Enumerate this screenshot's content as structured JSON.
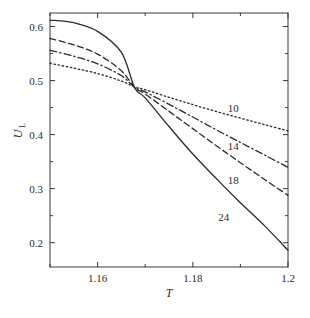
{
  "chart_data": {
    "type": "line",
    "title": "",
    "subtitle": "",
    "xlabel": "T",
    "ylabel": "U",
    "ylabel_sub": "L",
    "xlim": [
      1.15,
      1.2
    ],
    "ylim": [
      0.155,
      0.625
    ],
    "grid": false,
    "legend_position": "inline-right-of-curves",
    "xticks": [
      1.16,
      1.18,
      1.2
    ],
    "xtick_labels": [
      "1.16",
      "1.18",
      "1.2"
    ],
    "xticks_minor": [
      1.15,
      1.17,
      1.19
    ],
    "yticks": [
      0.2,
      0.3,
      0.4,
      0.5,
      0.6
    ],
    "ytick_labels": [
      "0.2",
      "0.3",
      "0.4",
      "0.5",
      "0.6"
    ],
    "yticks_minor": [
      0.25,
      0.35,
      0.45,
      0.55
    ],
    "crossing_point": [
      1.1678,
      0.487
    ],
    "x": [
      1.15,
      1.155,
      1.16,
      1.165,
      1.1678,
      1.17,
      1.175,
      1.18,
      1.185,
      1.19,
      1.195,
      1.2
    ],
    "series": [
      {
        "name": "10",
        "label": "10",
        "linestyle": "dotted",
        "color": "#2a2a2a",
        "label_position": [
          1.1885,
          0.442
        ],
        "values": [
          0.532,
          0.523,
          0.513,
          0.499,
          0.4885,
          0.483,
          0.469,
          0.4555,
          0.4425,
          0.4305,
          0.4185,
          0.407
        ]
      },
      {
        "name": "14",
        "label": "14",
        "linestyle": "dashdot",
        "color": "#2a2a2a",
        "label_position": [
          1.1885,
          0.372
        ],
        "values": [
          0.556,
          0.545,
          0.531,
          0.509,
          0.4875,
          0.479,
          0.456,
          0.4325,
          0.4085,
          0.3855,
          0.3625,
          0.3395
        ]
      },
      {
        "name": "18",
        "label": "18",
        "linestyle": "dashed",
        "color": "#2a2a2a",
        "label_position": [
          1.1885,
          0.308
        ],
        "values": [
          0.578,
          0.566,
          0.549,
          0.518,
          0.487,
          0.475,
          0.443,
          0.411,
          0.379,
          0.348,
          0.3175,
          0.2875
        ]
      },
      {
        "name": "24",
        "label": "24",
        "linestyle": "solid",
        "color": "#2a2a2a",
        "label_position": [
          1.1865,
          0.241
        ],
        "values": [
          0.612,
          0.607,
          0.591,
          0.552,
          0.4865,
          0.468,
          0.415,
          0.364,
          0.318,
          0.274,
          0.232,
          0.186
        ]
      }
    ]
  }
}
